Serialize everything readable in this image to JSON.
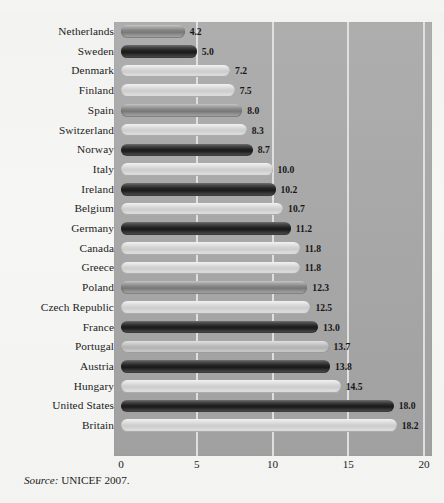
{
  "page": {
    "title_fragment": "",
    "source_prefix": "Source:",
    "source_text": "UNICEF 2007."
  },
  "chart_data": {
    "type": "bar",
    "orientation": "horizontal",
    "title": "",
    "xlabel": "",
    "ylabel": "",
    "xlim": [
      0,
      20
    ],
    "xticks": [
      0,
      5,
      10,
      15,
      20
    ],
    "xtick_labels": [
      "0",
      "5",
      "10",
      "15",
      "20"
    ],
    "grid": true,
    "gridlines_at": [
      5,
      10,
      15,
      20
    ],
    "legend": "none",
    "background_color": "#a9a9a9",
    "categories": [
      "Netherlands",
      "Sweden",
      "Denmark",
      "Finland",
      "Spain",
      "Switzerland",
      "Norway",
      "Italy",
      "Ireland",
      "Belgium",
      "Germany",
      "Canada",
      "Greece",
      "Poland",
      "Czech Republic",
      "France",
      "Portugal",
      "Austria",
      "Hungary",
      "United States",
      "Britain"
    ],
    "values": [
      4.2,
      5.0,
      7.2,
      7.5,
      8.0,
      8.3,
      8.7,
      10.0,
      10.2,
      10.7,
      11.2,
      11.8,
      11.8,
      12.3,
      12.5,
      13.0,
      13.7,
      13.8,
      14.5,
      18.0,
      18.2
    ],
    "value_labels": [
      "4.2",
      "5.0",
      "7.2",
      "7.5",
      "8.0",
      "8.3",
      "8.7",
      "10.0",
      "10.2",
      "10.7",
      "11.2",
      "11.8",
      "11.8",
      "12.3",
      "12.5",
      "13.0",
      "13.7",
      "13.8",
      "14.5",
      "18.0",
      "18.2"
    ],
    "bar_shades": [
      "mid",
      "dark",
      "light",
      "light",
      "mid",
      "light",
      "dark",
      "light",
      "dark",
      "light",
      "dark",
      "light",
      "light",
      "mid",
      "light",
      "dark",
      "midlight",
      "dark",
      "light",
      "dark",
      "light"
    ]
  }
}
